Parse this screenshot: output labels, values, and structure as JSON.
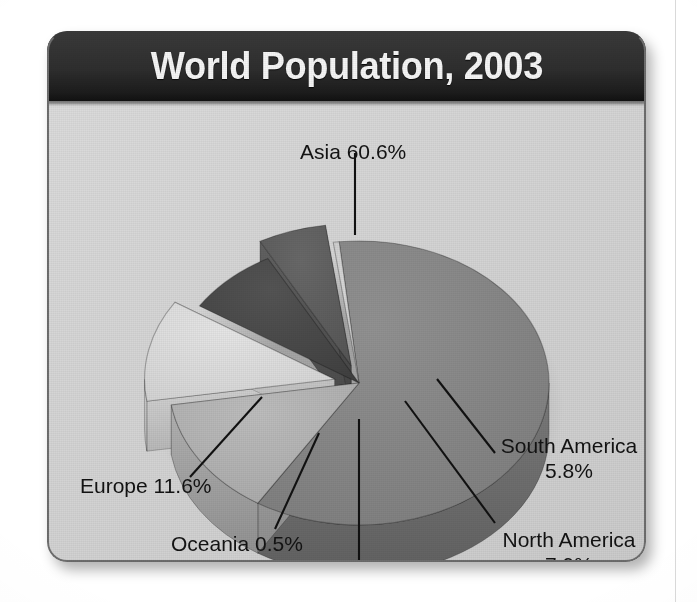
{
  "page": {
    "background_color": "#ffffff",
    "scanline_color": "#d9d9d9"
  },
  "card": {
    "background_color": "#d6d6d6",
    "border_color": "#6e6e6e",
    "header_background": "#2b2b2b",
    "header_text_color": "#f5f5f5"
  },
  "header": {
    "title": "World Population, 2003"
  },
  "labels": {
    "asia": "Asia 60.6%",
    "europe": "Europe 11.6%",
    "oceania": "Oceania 0.5%",
    "africa": "Africa 13.6%",
    "south_america": "South America 5.8%",
    "north_america": "North America 7.9%"
  },
  "chart_data": {
    "type": "pie",
    "title": "World Population, 2003",
    "subtitle": "",
    "xlabel": "",
    "ylabel": "",
    "unit": "percent",
    "three_d": true,
    "exploded_slices": [
      "Europe",
      "South America"
    ],
    "legend": "none (direct labels with leader lines)",
    "labels_show_percent": true,
    "categories": [
      "Asia",
      "Africa",
      "Europe",
      "North America",
      "South America",
      "Oceania"
    ],
    "values": [
      60.6,
      13.6,
      11.6,
      7.9,
      5.8,
      0.5
    ],
    "slices": [
      {
        "name": "Asia",
        "value": 60.6,
        "label": "Asia 60.6%",
        "color": "#8a8a8a",
        "side_color": "#6f6f6f",
        "exploded": false
      },
      {
        "name": "Africa",
        "value": 13.6,
        "label": "Africa 13.6%",
        "color": "#b4b4b4",
        "side_color": "#9a9a9a",
        "exploded": false
      },
      {
        "name": "Europe",
        "value": 11.6,
        "label": "Europe 11.6%",
        "color": "#dedede",
        "side_color": "#c2c2c2",
        "exploded": true
      },
      {
        "name": "North America",
        "value": 7.9,
        "label": "North America 7.9%",
        "color": "#4a4a4a",
        "side_color": "#3a3a3a",
        "exploded": false
      },
      {
        "name": "South America",
        "value": 5.8,
        "label": "South America 5.8%",
        "color": "#5e5e5e",
        "side_color": "#4d4d4d",
        "exploded": true
      },
      {
        "name": "Oceania",
        "value": 0.5,
        "label": "Oceania 0.5%",
        "color": "#cfcfcf",
        "side_color": "#b0b0b0",
        "exploded": false
      }
    ]
  }
}
